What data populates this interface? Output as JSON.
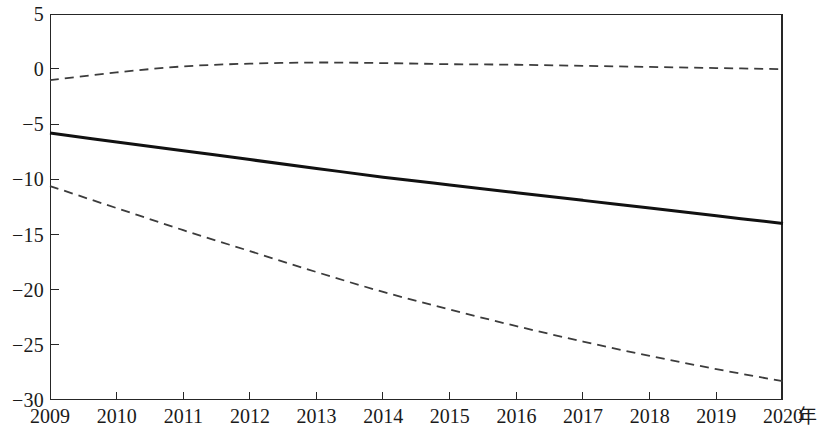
{
  "chart_data": {
    "type": "line",
    "title": "",
    "subtitle": "",
    "xlabel": "年",
    "ylabel": "",
    "x": [
      2009,
      2010,
      2011,
      2012,
      2013,
      2014,
      2015,
      2016,
      2017,
      2018,
      2019,
      2020
    ],
    "categories": [
      "2009",
      "2010",
      "2011",
      "2012",
      "2013",
      "2014",
      "2015",
      "2016",
      "2017",
      "2018",
      "2019",
      "2020"
    ],
    "xlim": [
      2009,
      2020
    ],
    "ylim": [
      -30,
      5
    ],
    "y_ticks": [
      5,
      0,
      -5,
      -10,
      -15,
      -20,
      -25,
      -30
    ],
    "y_tick_labels": [
      "5",
      "0",
      "−5",
      "−10",
      "−15",
      "−20",
      "−25",
      "−30"
    ],
    "x_ticks": [
      2009,
      2010,
      2011,
      2012,
      2013,
      2014,
      2015,
      2016,
      2017,
      2018,
      2019,
      2020
    ],
    "grid": false,
    "legend": null,
    "legend_position": "none",
    "annotations": [],
    "series": [
      {
        "name": "upper-bound",
        "style": "dashed",
        "color": "#3c3c3c",
        "width": 1.8,
        "values": [
          -1.0,
          -0.3,
          0.25,
          0.5,
          0.6,
          0.55,
          0.45,
          0.4,
          0.3,
          0.2,
          0.1,
          0.0
        ]
      },
      {
        "name": "central-forecast",
        "style": "solid",
        "color": "#111111",
        "width": 3.0,
        "values": [
          -5.8,
          -6.6,
          -7.4,
          -8.2,
          -9.0,
          -9.8,
          -10.5,
          -11.2,
          -11.9,
          -12.6,
          -13.3,
          -14.0
        ]
      },
      {
        "name": "lower-bound",
        "style": "dashed",
        "color": "#3c3c3c",
        "width": 1.8,
        "values": [
          -10.6,
          -12.6,
          -14.6,
          -16.5,
          -18.4,
          -20.2,
          -21.8,
          -23.3,
          -24.7,
          -26.0,
          -27.2,
          -28.3
        ]
      }
    ]
  },
  "axis": {
    "x_unit_label": "年"
  },
  "colors": {
    "frame": "#262626",
    "solid_line": "#111111",
    "dashed_line": "#3c3c3c",
    "background": "#ffffff"
  }
}
